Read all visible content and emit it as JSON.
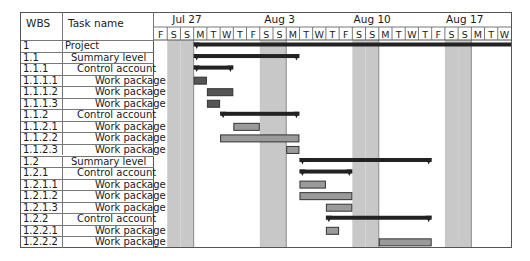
{
  "table": {
    "headers": {
      "wbs": "WBS",
      "task": "Task name"
    }
  },
  "chart_data": {
    "type": "gantt",
    "title": "",
    "week_labels": [
      {
        "label": "Jul 27",
        "day_index": 3
      },
      {
        "label": "Aug 3",
        "day_index": 10
      },
      {
        "label": "Aug 10",
        "day_index": 17
      },
      {
        "label": "Aug 17",
        "day_index": 24
      }
    ],
    "days": [
      "F",
      "S",
      "S",
      "M",
      "T",
      "W",
      "T",
      "F",
      "S",
      "S",
      "M",
      "T",
      "W",
      "T",
      "F",
      "S",
      "S",
      "M",
      "T",
      "W",
      "T",
      "F",
      "S",
      "S",
      "M",
      "T",
      "W"
    ],
    "date_range": [
      "Jul 24",
      "Aug 19"
    ],
    "weekend_day_indices": [
      1,
      2,
      8,
      9,
      15,
      16,
      22,
      23
    ],
    "week_boundary_indices": [
      2,
      9,
      16,
      23
    ],
    "tasks": [
      {
        "wbs": "1",
        "name": "Project",
        "level": 0,
        "kind": "summary",
        "start": 3,
        "end": 27,
        "open_end": true
      },
      {
        "wbs": "1.1",
        "name": "Summary level",
        "level": 1,
        "kind": "summary",
        "start": 3,
        "end": 11
      },
      {
        "wbs": "1.1.1",
        "name": "Control account",
        "level": 2,
        "kind": "summary",
        "start": 3,
        "end": 6
      },
      {
        "wbs": "1.1.1.1",
        "name": "Work package",
        "level": 3,
        "kind": "task-dark",
        "start": 3,
        "end": 4
      },
      {
        "wbs": "1.1.1.2",
        "name": "Work package",
        "level": 3,
        "kind": "task-dark",
        "start": 4,
        "end": 6
      },
      {
        "wbs": "1.1.1.3",
        "name": "Work package",
        "level": 3,
        "kind": "task-dark",
        "start": 4,
        "end": 5
      },
      {
        "wbs": "1.1.2",
        "name": "Control account",
        "level": 2,
        "kind": "summary",
        "start": 5,
        "end": 11
      },
      {
        "wbs": "1.1.2.1",
        "name": "Work package",
        "level": 3,
        "kind": "task",
        "start": 6,
        "end": 8
      },
      {
        "wbs": "1.1.2.2",
        "name": "Work package",
        "level": 3,
        "kind": "task",
        "start": 5,
        "end": 11
      },
      {
        "wbs": "1.1.2.3",
        "name": "Work package",
        "level": 3,
        "kind": "task",
        "start": 10,
        "end": 11
      },
      {
        "wbs": "1.2",
        "name": "Summary level",
        "level": 1,
        "kind": "summary",
        "start": 11,
        "end": 21
      },
      {
        "wbs": "1.2.1",
        "name": "Control account",
        "level": 2,
        "kind": "summary",
        "start": 11,
        "end": 15
      },
      {
        "wbs": "1.2.1.1",
        "name": "Work package",
        "level": 3,
        "kind": "task",
        "start": 11,
        "end": 13
      },
      {
        "wbs": "1.2.1.2",
        "name": "Work package",
        "level": 3,
        "kind": "task",
        "start": 11,
        "end": 15
      },
      {
        "wbs": "1.2.1.3",
        "name": "Work package",
        "level": 3,
        "kind": "task",
        "start": 13,
        "end": 15
      },
      {
        "wbs": "1.2.2",
        "name": "Control account",
        "level": 2,
        "kind": "summary",
        "start": 13,
        "end": 21
      },
      {
        "wbs": "1.2.2.1",
        "name": "Work package",
        "level": 3,
        "kind": "task",
        "start": 13,
        "end": 14
      },
      {
        "wbs": "1.2.2.2",
        "name": "Work package",
        "level": 3,
        "kind": "task",
        "start": 17,
        "end": 21
      }
    ],
    "colors": {
      "summary": "#222222",
      "task": "#9a9a9a",
      "task_dark": "#555555",
      "task_border": "#333333",
      "weekend": "#c8c8c8",
      "grid": "#777777"
    }
  }
}
